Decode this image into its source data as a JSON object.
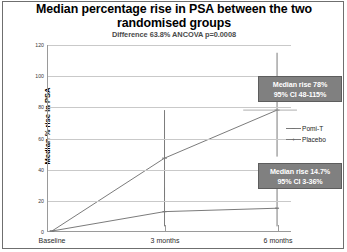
{
  "figure": {
    "title": "Median percentage rise in PSA between the two randomised groups",
    "subtitle": "Difference 63.8% ANCOVA p=0.0008"
  },
  "chart_data": {
    "type": "line",
    "title": "Median percentage rise in PSA between the two randomised groups",
    "subtitle": "Difference 63.8% ANCOVA p=0.0008",
    "xlabel": "",
    "ylabel": "Median % rise in PSA",
    "categories": [
      "Baseline",
      "3 months",
      "6 months"
    ],
    "ylim": [
      0,
      120
    ],
    "ytick_labels": [
      "0",
      "20",
      "40",
      "60",
      "80",
      "100",
      "120"
    ],
    "yticks": [
      0,
      20,
      40,
      60,
      80,
      100,
      120
    ],
    "grid": true,
    "legend_position": "right",
    "series": [
      {
        "name": "Placebo",
        "values": [
          0,
          47,
          78
        ],
        "errors_low": [
          0,
          22,
          48
        ],
        "errors_high": [
          0,
          78,
          115
        ],
        "color": "#7a7a7a",
        "marker": "plus"
      },
      {
        "name": "Pomi-T",
        "values": [
          0,
          12.5,
          14.7
        ],
        "errors_low": [
          0,
          3,
          3
        ],
        "errors_high": [
          0,
          28,
          36
        ],
        "color": "#7a7a7a",
        "marker": "dash"
      }
    ],
    "annotations": [
      {
        "name": "upper-callout",
        "line1": "Median rise 78%",
        "line2": "95% CI 48-115%"
      },
      {
        "name": "lower-callout",
        "line1": "Median rise 14.7%",
        "line2": "95% CI 3-36%"
      }
    ]
  },
  "legend": {
    "items": [
      {
        "label": "Pomi-T"
      },
      {
        "label": "Placebo"
      }
    ]
  }
}
